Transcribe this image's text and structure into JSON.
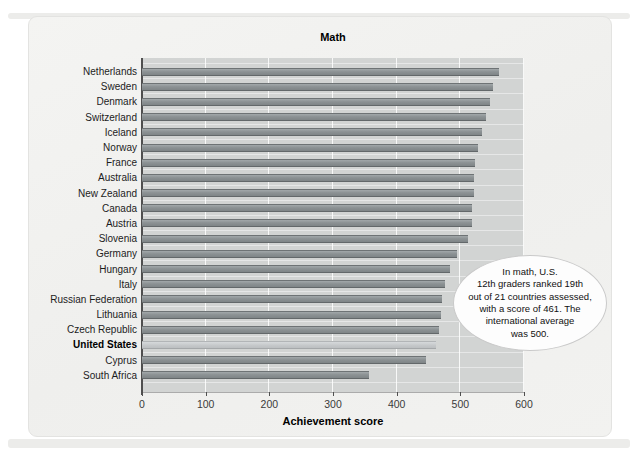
{
  "title": "Math",
  "xlabel": "Achievement score",
  "annotation": {
    "text": "In math, U.S. 12th graders ranked 19th out of 21 countries assessed, with a score of 461. The international average was 500.",
    "lines": [
      "In math, U.S.",
      "12th graders ranked 19th",
      "out of 21 countries assessed,",
      "with a score of 461. The",
      "international average",
      "was 500."
    ]
  },
  "chart_data": {
    "type": "bar",
    "orientation": "horizontal",
    "title": "Math",
    "xlabel": "Achievement score",
    "xlim": [
      0,
      600
    ],
    "x_ticks": [
      0,
      100,
      200,
      300,
      400,
      500,
      600
    ],
    "grid": "white vertical gridlines every 100",
    "categories": [
      "Netherlands",
      "Sweden",
      "Denmark",
      "Switzerland",
      "Iceland",
      "Norway",
      "France",
      "Australia",
      "New Zealand",
      "Canada",
      "Austria",
      "Slovenia",
      "Germany",
      "Hungary",
      "Italy",
      "Russian Federation",
      "Lithuania",
      "Czech Republic",
      "United States",
      "Cyprus",
      "South Africa"
    ],
    "values": [
      560,
      552,
      547,
      540,
      534,
      528,
      523,
      522,
      522,
      519,
      518,
      512,
      495,
      483,
      476,
      471,
      469,
      466,
      461,
      446,
      356
    ],
    "highlighted_category": "United States",
    "colors": {
      "bar": "#8c9294",
      "highlight_bar": "#c4c7c9",
      "plot_background": "#d2d4d3",
      "panel_background": "#f2f2f0",
      "gridline": "#ffffff",
      "annotation_fill": "#fdfdfd",
      "annotation_border": "#c9c9c9"
    }
  }
}
